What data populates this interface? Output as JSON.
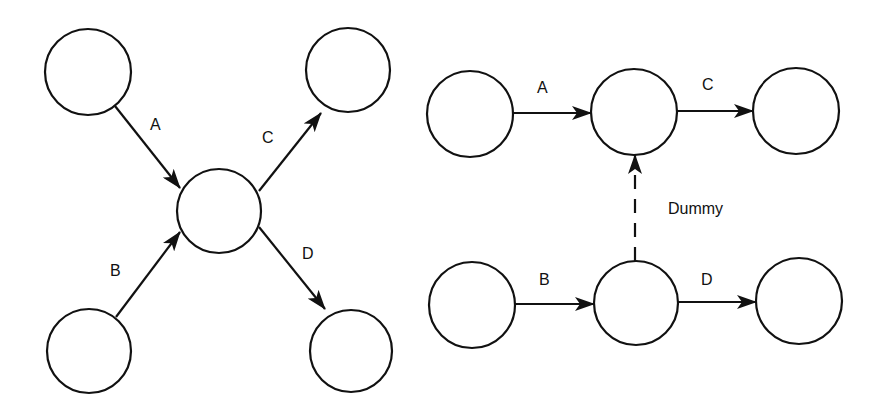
{
  "diagram": {
    "left": {
      "nodes": [
        {
          "id": "n1",
          "cx": 88,
          "cy": 72,
          "r": 43
        },
        {
          "id": "n2",
          "cx": 348,
          "cy": 70,
          "r": 42
        },
        {
          "id": "n3",
          "cx": 219,
          "cy": 211,
          "r": 42
        },
        {
          "id": "n4",
          "cx": 89,
          "cy": 351,
          "r": 42
        },
        {
          "id": "n5",
          "cx": 351,
          "cy": 351,
          "r": 41
        }
      ],
      "edges": [
        {
          "label": "A",
          "from": "n1",
          "to": "n3"
        },
        {
          "label": "B",
          "from": "n4",
          "to": "n3"
        },
        {
          "label": "C",
          "from": "n3",
          "to": "n2"
        },
        {
          "label": "D",
          "from": "n3",
          "to": "n5"
        }
      ]
    },
    "right": {
      "nodes": [
        {
          "id": "m1",
          "cx": 470,
          "cy": 114,
          "r": 43
        },
        {
          "id": "m2",
          "cx": 634,
          "cy": 112,
          "r": 43
        },
        {
          "id": "m3",
          "cx": 796,
          "cy": 111,
          "r": 43
        },
        {
          "id": "m4",
          "cx": 472,
          "cy": 305,
          "r": 43
        },
        {
          "id": "m5",
          "cx": 636,
          "cy": 303,
          "r": 42
        },
        {
          "id": "m6",
          "cx": 799,
          "cy": 301,
          "r": 43
        }
      ],
      "edges": [
        {
          "label": "A",
          "from": "m1",
          "to": "m2"
        },
        {
          "label": "C",
          "from": "m2",
          "to": "m3"
        },
        {
          "label": "B",
          "from": "m4",
          "to": "m5"
        },
        {
          "label": "D",
          "from": "m5",
          "to": "m6"
        },
        {
          "label": "Dummy",
          "from": "m5",
          "to": "m2",
          "style": "dashed"
        }
      ]
    },
    "labels": {
      "left_a": "A",
      "left_b": "B",
      "left_c": "C",
      "left_d": "D",
      "right_a": "A",
      "right_b": "B",
      "right_c": "C",
      "right_d": "D",
      "dummy": "Dummy"
    }
  }
}
